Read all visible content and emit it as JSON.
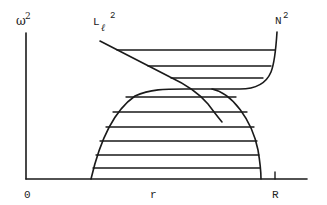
{
  "diagram": {
    "title": "",
    "labels": {
      "y_axis": "ω",
      "y_axis_sup": "2",
      "lamb_curve": "L",
      "lamb_sub": "ℓ",
      "lamb_sup": "2",
      "bv_curve": "N",
      "bv_sup": "2",
      "origin": "0",
      "x_axis": "r",
      "radius_tick": "R"
    },
    "regions": [
      {
        "name": "g-mode cavity",
        "description": "hatched region bounded above by N² and below-left by L_ℓ² (upper)"
      },
      {
        "name": "p-mode cavity",
        "description": "hatched dome region under L_ℓ² / N² envelope (lower)"
      }
    ],
    "colors": {
      "ink": "#1a1a1a",
      "background": "#ffffff"
    }
  }
}
